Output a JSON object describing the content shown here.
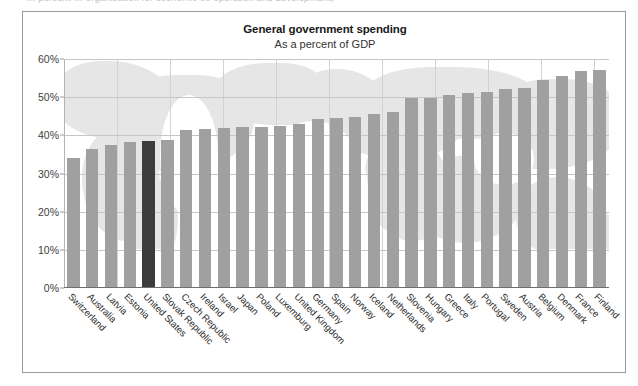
{
  "page": {
    "cut_off_line": "… percent … organisation for economic co-operation and development,"
  },
  "figure": {
    "title": "General government spending",
    "subtitle": "As a percent of GDP"
  },
  "colors": {
    "bar": "#a0a0a0",
    "bar_highlight": "#3c3c3c",
    "gridline": "#c6c6c6",
    "axis": "#6f6f6f",
    "frame": "#9a9a9a",
    "watermark": "#e6e6e6",
    "text": "#2b2b2b"
  },
  "chart_data": {
    "type": "bar",
    "title": "General government spending",
    "subtitle": "As a percent of GDP",
    "xlabel": "",
    "ylabel": "",
    "ylim": [
      0,
      60
    ],
    "ytick_labels": [
      "0%",
      "10%",
      "20%",
      "30%",
      "40%",
      "50%",
      "60%"
    ],
    "yticks": [
      0,
      10,
      20,
      30,
      40,
      50,
      60
    ],
    "grid": true,
    "legend": false,
    "highlight_category": "United States",
    "categories": [
      "Switzerland",
      "Australia",
      "Latvia",
      "Estonia",
      "United States",
      "Slovak Republic",
      "Czech Republic",
      "Ireland",
      "Israel",
      "Japan",
      "Poland",
      "Luxemburg",
      "United Kingdom",
      "Germany",
      "Spain",
      "Norway",
      "Iceland",
      "Netherlands",
      "Slovenia",
      "Hungary",
      "Greece",
      "Italy",
      "Portugal",
      "Sweden",
      "Austria",
      "Belgium",
      "Denmark",
      "France",
      "Finland"
    ],
    "values": [
      34.0,
      36.5,
      37.5,
      38.3,
      38.6,
      38.7,
      41.4,
      41.6,
      41.9,
      42.2,
      42.3,
      42.5,
      43.0,
      44.3,
      44.5,
      44.8,
      45.7,
      46.1,
      49.8,
      49.9,
      50.5,
      51.0,
      51.3,
      52.2,
      52.5,
      54.6,
      55.6,
      56.9,
      57.1
    ]
  }
}
